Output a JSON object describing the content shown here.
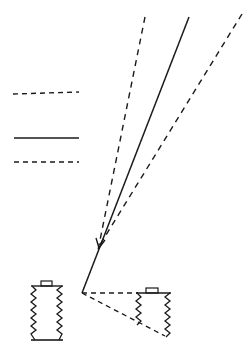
{
  "diagram": {
    "colors": {
      "ink": "#1a1a1a",
      "background": "#ffffff"
    },
    "legend": [
      {
        "style": "dashed",
        "y": 93
      },
      {
        "style": "solid",
        "y": 138
      },
      {
        "style": "dashed",
        "y": 162
      }
    ],
    "rays": [
      {
        "name": "left-dashed-ray",
        "style": "dashed",
        "from": [
          145,
          17
        ],
        "to": [
          98,
          250
        ]
      },
      {
        "name": "center-solid-ray",
        "style": "solid",
        "from": [
          189,
          17
        ],
        "to": [
          82,
          293
        ]
      },
      {
        "name": "right-dashed-ray",
        "style": "dashed",
        "from": [
          242,
          14
        ],
        "to": [
          98,
          248
        ]
      }
    ],
    "arrowhead": {
      "at": [
        100,
        245
      ]
    },
    "bellows": [
      {
        "name": "left-bellows",
        "x": 31,
        "y": 283,
        "width": 32,
        "height": 57
      },
      {
        "name": "right-bellows",
        "x": 136,
        "y": 293,
        "width": 35,
        "height": 43
      }
    ],
    "projection_lines": [
      {
        "from": [
          82,
          293
        ],
        "to": [
          138,
          293
        ]
      },
      {
        "from": [
          82,
          293
        ],
        "to": [
          165,
          336
        ]
      }
    ]
  }
}
